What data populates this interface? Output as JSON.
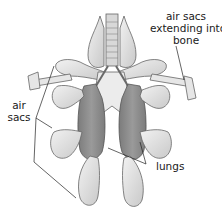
{
  "diagram": {
    "labels": {
      "air_sacs_bone": [
        "air sacs",
        "extending into",
        "bone"
      ],
      "air_sacs": [
        "air",
        "sacs"
      ],
      "lungs": "lungs"
    },
    "colors": {
      "lung_fill": "#8f8f8f",
      "sac_fill": "#e4e4e4",
      "outline": "#555555",
      "leader_line": "#222222",
      "text": "#1a1a1a"
    }
  }
}
